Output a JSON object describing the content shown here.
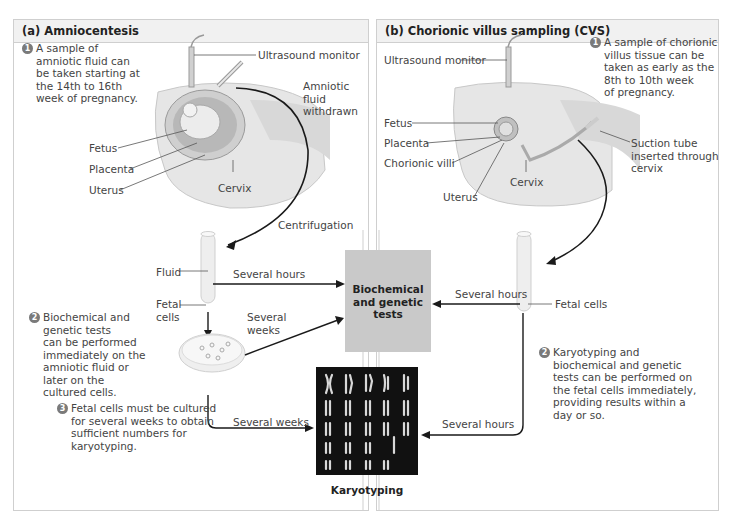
{
  "panel_a": {
    "title": "(a) Amniocentesis",
    "step1": {
      "num": "1",
      "text": "A sample of\namniotic fluid can\nbe taken starting at\nthe 14th to 16th\nweek of pregnancy."
    },
    "step2": {
      "num": "2",
      "text": "Biochemical and\ngenetic tests\ncan be performed\nimmediately on the\namniotic fluid or\nlater on the\ncultured cells."
    },
    "step3": {
      "num": "3",
      "text": "Fetal cells must be cultured\nfor several weeks to obtain\nsufficient numbers for\nkaryotyping."
    },
    "labels": {
      "ultrasound": "Ultrasound monitor",
      "amniotic_withdrawn": "Amniotic\nfluid\nwithdrawn",
      "fetus": "Fetus",
      "placenta": "Placenta",
      "uterus": "Uterus",
      "cervix": "Cervix",
      "centrifugation": "Centrifugation",
      "fluid": "Fluid",
      "fetal_cells": "Fetal\ncells",
      "several_hours": "Several hours",
      "several_weeks_1": "Several\nweeks",
      "several_weeks_2": "Several weeks"
    }
  },
  "panel_b": {
    "title": "(b) Chorionic villus sampling (CVS)",
    "step1": {
      "num": "1",
      "text": "A sample of chorionic\nvillus tissue can be\ntaken as early as the\n8th to 10th week\nof pregnancy."
    },
    "step2": {
      "num": "2",
      "text": "Karyotyping and\nbiochemical and genetic\ntests can be performed on\nthe fetal cells immediately,\nproviding results within a\nday or so."
    },
    "labels": {
      "ultrasound": "Ultrasound monitor",
      "fetus": "Fetus",
      "placenta": "Placenta",
      "chorionic_villi": "Chorionic villi",
      "uterus": "Uterus",
      "cervix": "Cervix",
      "suction_tube": "Suction tube\ninserted through\ncervix",
      "fetal_cells": "Fetal cells",
      "several_hours_1": "Several hours",
      "several_hours_2": "Several hours"
    }
  },
  "center": {
    "biochemical_box": "Biochemical\nand genetic\ntests",
    "karyotyping_label": "Karyotyping"
  },
  "colors": {
    "panel_border": "#cfcfcf",
    "header_bg": "#f1f1f1",
    "bio_box": "#c9c9c9",
    "karyotype_bg": "#111111",
    "badge": "#7a7a7a",
    "tissue": "#e6e6e6",
    "arrow": "#1a1a1a"
  }
}
